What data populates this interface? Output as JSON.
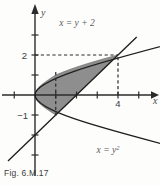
{
  "figure": {
    "caption": "Fig. 6.M.17",
    "axis_labels": {
      "x": "x",
      "y": "y"
    },
    "tick_labels": {
      "y_two": "2",
      "y_neg_one": "−1",
      "x_four": "4"
    },
    "curve_labels": {
      "line": "x = y + 2",
      "parabola": "x = y",
      "parabola_exp": "2"
    },
    "colors": {
      "background": "#fdfdfc",
      "axis": "#2b2b2b",
      "curve": "#1f1f1f",
      "shade_fill": "#8e8e8e",
      "shade_edge": "#6f6f6f",
      "dashed": "#2b2b2b",
      "caption_text": "#3b3b3b",
      "label_text": "#5a5a5a"
    }
  },
  "chart_data": {
    "type": "line",
    "title": "",
    "subtitle": "",
    "xlabel": "x",
    "ylabel": "y",
    "xlim": [
      -1.7,
      6.0
    ],
    "ylim": [
      -3.4,
      4.4
    ],
    "grid": false,
    "legend": "none",
    "origin_px": [
      35,
      95
    ],
    "px_per_unit": {
      "x": 20.75,
      "y": 20.0
    },
    "x_ticks": [
      -1,
      1,
      2,
      3,
      4,
      5
    ],
    "x_tick_labels": {
      "4": "4"
    },
    "y_ticks": [
      -3,
      -2,
      -1,
      1,
      2,
      3
    ],
    "y_tick_labels": {
      "2": "2",
      "-1": "−1"
    },
    "series": [
      {
        "name": "x = y + 2",
        "type": "line",
        "equation": "x = y + 2",
        "label": "x = y + 2",
        "label_at": [
          2.35,
          3.3
        ],
        "y_range": [
          -3.3,
          2.9
        ]
      },
      {
        "name": "x = y^2",
        "type": "parabola",
        "equation": "x = y^2",
        "label": "x = y²",
        "label_at": [
          2.6,
          -2.6
        ],
        "y_range": [
          -2.55,
          2.55
        ]
      }
    ],
    "shaded_region": {
      "label": "region between x = y² and x = y + 2",
      "between": [
        "x = y^2",
        "x = y + 2"
      ],
      "y_from": -1,
      "y_to": 2,
      "fill": "#8e8e8e"
    },
    "intersections": [
      {
        "point": [
          1,
          -1
        ],
        "label": "−1",
        "dashed_guides": [
          "vertical",
          "horizontal"
        ]
      },
      {
        "point": [
          4,
          2
        ],
        "label": "4",
        "dashed_guides": [
          "vertical",
          "horizontal"
        ]
      }
    ],
    "annotations": [
      {
        "text": "2",
        "at": [
          0,
          2
        ],
        "placement": "y-axis tick label"
      },
      {
        "text": "−1",
        "at": [
          0,
          -1
        ],
        "placement": "y-axis tick label"
      },
      {
        "text": "4",
        "at": [
          4,
          0
        ],
        "placement": "x-axis tick label"
      }
    ]
  }
}
